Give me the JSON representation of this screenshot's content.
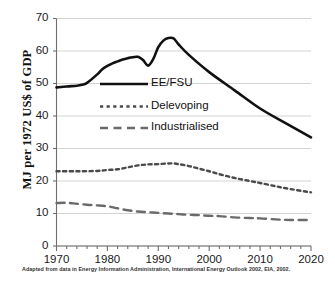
{
  "chart_data": {
    "type": "line",
    "title": "",
    "xlabel": "",
    "ylabel": "MJ per 1972 US$ of GDP",
    "xlim": [
      1970,
      2020
    ],
    "ylim": [
      0,
      70
    ],
    "ytick_step": 10,
    "xtick_step": 10,
    "xminor_step": 2,
    "grid": "horizontal",
    "legend_position": "inside-upper-left",
    "yticks": [
      "0",
      "10",
      "20",
      "30",
      "40",
      "50",
      "60",
      "70"
    ],
    "xticks": [
      "1970",
      "1980",
      "1990",
      "2000",
      "2010",
      "2020"
    ],
    "series": [
      {
        "name": "EE/FSU",
        "style": "solid",
        "color": "#111111",
        "width": 2.6,
        "x": [
          1970,
          1972,
          1974,
          1975,
          1976,
          1978,
          1979,
          1980,
          1981,
          1982,
          1983,
          1984,
          1985,
          1986,
          1987,
          1988,
          1989,
          1990,
          1991,
          1992,
          1993,
          1994,
          1996,
          2000,
          2005,
          2010,
          2015,
          2020
        ],
        "values": [
          48.8,
          49.1,
          49.3,
          49.6,
          50.2,
          52.8,
          54.4,
          55.4,
          56.2,
          56.8,
          57.4,
          57.8,
          58.1,
          58.2,
          57.2,
          55.5,
          57.5,
          61.2,
          63.2,
          64.0,
          63.9,
          62.0,
          58.8,
          53.5,
          47.9,
          42.3,
          37.8,
          33.4
        ]
      },
      {
        "name": "Delevoping",
        "style": "dotted",
        "color": "#4a4a4a",
        "width": 2.4,
        "x": [
          1970,
          1974,
          1978,
          1980,
          1982,
          1984,
          1986,
          1988,
          1990,
          1992,
          1993,
          1994,
          1996,
          1998,
          2000,
          2002,
          2004,
          2006,
          2008,
          2010,
          2013,
          2016,
          2020
        ],
        "values": [
          23.0,
          23.0,
          23.1,
          23.4,
          23.6,
          24.2,
          24.8,
          25.1,
          25.2,
          25.4,
          25.4,
          25.2,
          24.6,
          23.8,
          23.0,
          22.1,
          21.3,
          20.6,
          20.0,
          19.4,
          18.4,
          17.5,
          16.5
        ]
      },
      {
        "name": "Industrialised",
        "style": "dashed",
        "color": "#6a6a6a",
        "width": 2.4,
        "x": [
          1970,
          1972,
          1974,
          1976,
          1978,
          1980,
          1982,
          1984,
          1986,
          1988,
          1990,
          1992,
          1994,
          1996,
          1998,
          2000,
          2002,
          2005,
          2008,
          2010,
          2013,
          2016,
          2020
        ],
        "values": [
          13.2,
          13.3,
          13.0,
          12.7,
          12.5,
          12.2,
          11.6,
          11.0,
          10.6,
          10.4,
          10.2,
          10.0,
          9.8,
          9.6,
          9.5,
          9.3,
          9.2,
          8.8,
          8.6,
          8.5,
          8.2,
          8.0,
          8.0
        ]
      }
    ],
    "caption": "Adapted from data in Energy Information Administration, International Energy Outlook 2002, EIA, 2002."
  },
  "legend": {
    "items": [
      {
        "label": "EE/FSU"
      },
      {
        "label": "Delevoping"
      },
      {
        "label": "Industrialised"
      }
    ]
  }
}
